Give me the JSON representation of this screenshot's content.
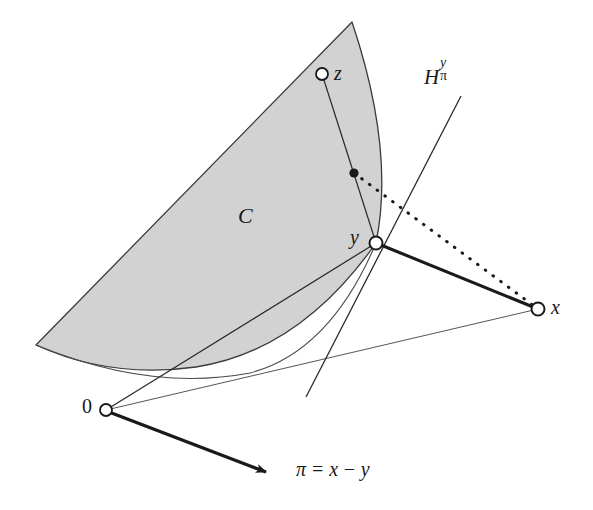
{
  "figure": {
    "type": "geometry-diagram",
    "background_color": "#ffffff",
    "ink_color": "#1a1a1a",
    "cone_fill_color": "#d2d2d2",
    "cone_stroke_color": "#3a3a3a"
  },
  "labels": {
    "cone": "C",
    "point_z": "z",
    "point_y": "y",
    "point_x": "x",
    "origin": "0",
    "hyperplane_base": "H",
    "hyperplane_superscript": "y",
    "hyperplane_subscript": "π",
    "pi_symbol": "π",
    "pi_equals": "=",
    "pi_x": "x",
    "pi_minus": "−",
    "pi_y": "y"
  },
  "points": {
    "z": {
      "x": 322,
      "y": 74,
      "marker": "open-circle",
      "radius": 6
    },
    "y": {
      "x": 376,
      "y": 243,
      "marker": "open-circle",
      "radius": 6.5
    },
    "x": {
      "x": 538,
      "y": 309,
      "marker": "open-circle",
      "radius": 6.5
    },
    "origin": {
      "x": 106,
      "y": 410,
      "marker": "open-circle",
      "radius": 6
    },
    "foot": {
      "x": 354,
      "y": 173,
      "marker": "filled-dot",
      "radius": 4.5
    }
  },
  "cone": {
    "apex": {
      "x": 352,
      "y": 22
    },
    "upper_left_edge_end": {
      "x": 36,
      "y": 345
    },
    "right_boundary_end": {
      "x": 376,
      "y": 243
    },
    "bottom_arc_control": {
      "x": 190,
      "y": 400
    }
  },
  "segments": [
    {
      "name": "z-to-y",
      "from": "z",
      "to": "y",
      "style": "thin-solid"
    },
    {
      "name": "y-to-x",
      "from": "y",
      "to": "x",
      "style": "thick-solid"
    },
    {
      "name": "foot-to-x",
      "from": "foot",
      "to": "x",
      "style": "dotted"
    },
    {
      "name": "origin-to-y",
      "from": "origin",
      "to": "y",
      "style": "thin-solid"
    },
    {
      "name": "origin-to-x",
      "from": "origin",
      "to": "x",
      "style": "thin-solid"
    },
    {
      "name": "origin-to-pi",
      "from": "origin",
      "to": {
        "x": 274,
        "y": 475
      },
      "style": "thick-arrow"
    },
    {
      "name": "hyperplane",
      "from": {
        "x": 461,
        "y": 96
      },
      "to": {
        "x": 306,
        "y": 397
      },
      "style": "thin-solid"
    }
  ]
}
